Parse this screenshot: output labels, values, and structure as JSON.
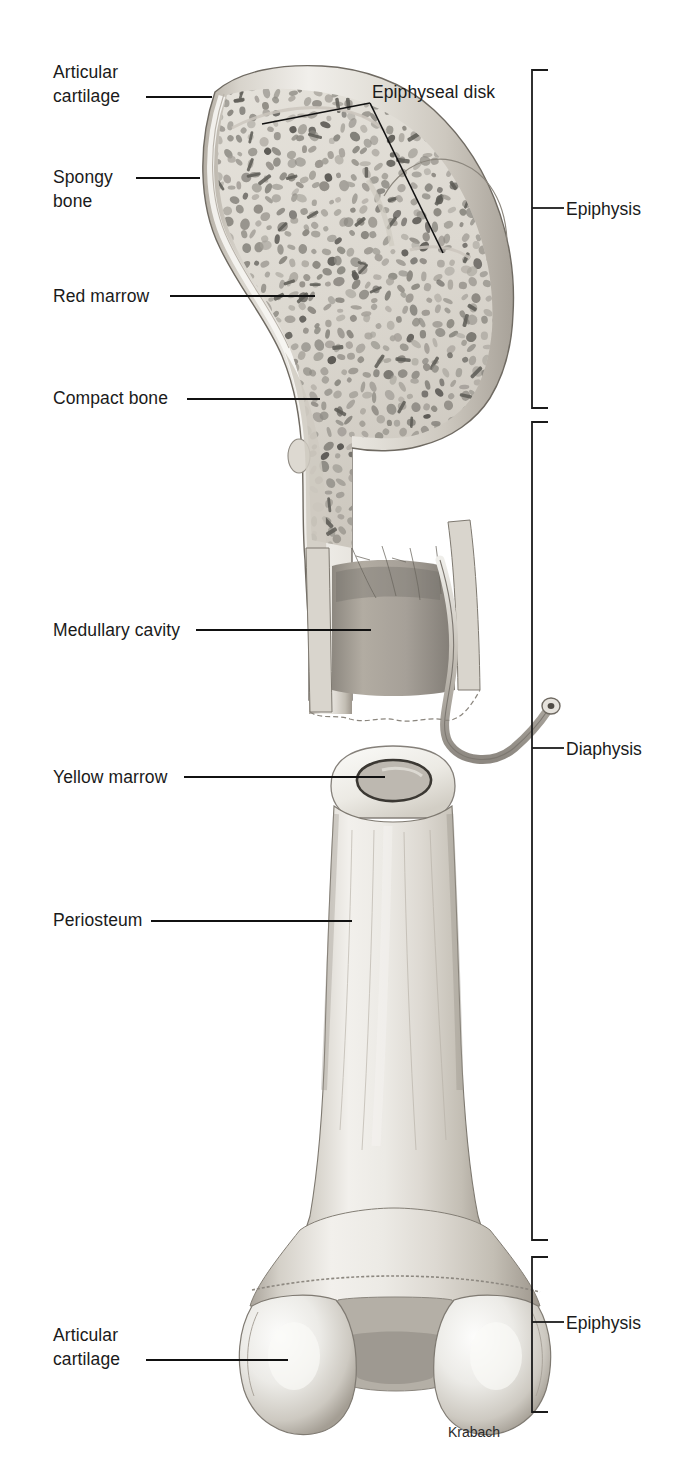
{
  "figure": {
    "artist_signature": "Krabach",
    "partial_top_text": "the spongy bone contains red marrow, yellow marrow, and blood"
  },
  "colors": {
    "ink": "#1a1a1a",
    "leader_line": "#111111",
    "bracket": "#1b1b1b",
    "compact_bone_light": "#e7e4de",
    "compact_bone_mid": "#c9c4bb",
    "compact_bone_dark": "#9e988e",
    "cartilage": "#efeee9",
    "spongy_matrix": "#d6d2c9",
    "trabecula": "#8d8a83",
    "trabecula_dark": "#5c5a55",
    "marrow_cavity": "#a9a49b",
    "background": "#ffffff"
  },
  "left_labels": [
    {
      "id": "articular-cartilage-top",
      "lines": [
        "Articular",
        "cartilage"
      ],
      "text_x": 53,
      "text_y": 60,
      "leader": {
        "x1": 146,
        "y1": 97,
        "x2": 212,
        "y2": 97
      }
    },
    {
      "id": "spongy-bone",
      "lines": [
        "Spongy",
        "bone"
      ],
      "text_x": 53,
      "text_y": 165,
      "leader": {
        "x1": 136,
        "y1": 178,
        "x2": 200,
        "y2": 178
      }
    },
    {
      "id": "red-marrow",
      "lines": [
        "Red marrow"
      ],
      "text_x": 53,
      "text_y": 284,
      "leader": {
        "x1": 170,
        "y1": 296,
        "x2": 315,
        "y2": 296
      }
    },
    {
      "id": "compact-bone",
      "lines": [
        "Compact bone"
      ],
      "text_x": 53,
      "text_y": 386,
      "leader": {
        "x1": 187,
        "y1": 399,
        "x2": 320,
        "y2": 399
      }
    },
    {
      "id": "medullary-cavity",
      "lines": [
        "Medullary cavity"
      ],
      "text_x": 53,
      "text_y": 618,
      "leader": {
        "x1": 196,
        "y1": 630,
        "x2": 371,
        "y2": 630
      }
    },
    {
      "id": "yellow-marrow",
      "lines": [
        "Yellow marrow"
      ],
      "text_x": 53,
      "text_y": 765,
      "leader": {
        "x1": 184,
        "y1": 777,
        "x2": 385,
        "y2": 777
      }
    },
    {
      "id": "periosteum",
      "lines": [
        "Periosteum"
      ],
      "text_x": 53,
      "text_y": 908,
      "leader": {
        "x1": 151,
        "y1": 921,
        "x2": 352,
        "y2": 921
      }
    },
    {
      "id": "articular-cartilage-bottom",
      "lines": [
        "Articular",
        "cartilage"
      ],
      "text_x": 53,
      "text_y": 1323,
      "leader": {
        "x1": 146,
        "y1": 1360,
        "x2": 288,
        "y2": 1360
      }
    }
  ],
  "callout_labels": [
    {
      "id": "epiphyseal-disk",
      "text": "Epiphyseal disk",
      "text_x": 372,
      "text_y": 80,
      "leaders": [
        {
          "points": "370,103 262,124"
        },
        {
          "points": "370,103 443,253"
        }
      ]
    }
  ],
  "brackets": [
    {
      "id": "bracket-epiphysis-top",
      "label": "Epiphysis",
      "x": 532,
      "y_top": 70,
      "y_bottom": 408,
      "tick_y": 208,
      "label_x": 566,
      "label_y": 197
    },
    {
      "id": "bracket-diaphysis",
      "label": "Diaphysis",
      "x": 532,
      "y_top": 422,
      "y_bottom": 1240,
      "tick_y": 748,
      "label_x": 566,
      "label_y": 737
    },
    {
      "id": "bracket-epiphysis-bottom",
      "label": "Epiphysis",
      "x": 532,
      "y_top": 1257,
      "y_bottom": 1412,
      "tick_y": 1322,
      "label_x": 566,
      "label_y": 1311
    }
  ],
  "signature": {
    "text": "Krabach",
    "x": 448,
    "y": 1424
  }
}
